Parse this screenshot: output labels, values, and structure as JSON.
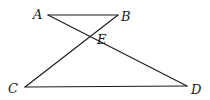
{
  "figure": {
    "points": {
      "A": {
        "label": "A",
        "x": 48,
        "y": 15
      },
      "B": {
        "label": "B",
        "x": 118,
        "y": 15
      },
      "E": {
        "label": "E",
        "x": 89,
        "y": 37
      },
      "C": {
        "label": "C",
        "x": 25,
        "y": 87
      },
      "D": {
        "label": "D",
        "x": 187,
        "y": 86
      }
    },
    "segments": [
      {
        "name": "AB",
        "from": "A",
        "to": "B"
      },
      {
        "name": "AD",
        "from": "A",
        "to": "D"
      },
      {
        "name": "BC",
        "from": "B",
        "to": "C"
      },
      {
        "name": "CD",
        "from": "C",
        "to": "D"
      }
    ],
    "labels": {
      "A": "A",
      "B": "B",
      "C": "C",
      "D": "D",
      "E": "E"
    },
    "stroke_color": "#1a1a1a"
  }
}
